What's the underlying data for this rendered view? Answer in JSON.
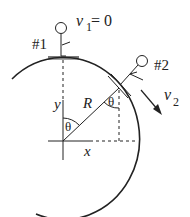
{
  "diagram": {
    "type": "physics-free-body",
    "labels": {
      "skier1": "#1",
      "skier2": "#2",
      "v1_symbol": "v",
      "v1_sub": "1",
      "v1_eq": " = 0",
      "v2_symbol": "v",
      "v2_sub": "2",
      "radius": "R",
      "theta_center": "θ",
      "theta_vertical": "θ",
      "y_axis": "y",
      "x_axis": "x"
    },
    "colors": {
      "stroke": "#222222",
      "background": "#ffffff"
    }
  }
}
